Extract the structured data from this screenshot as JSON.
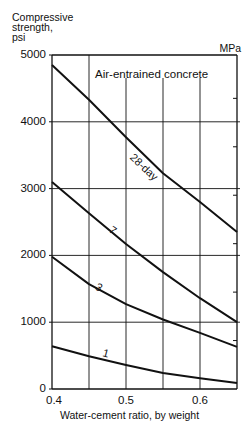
{
  "chart_data": {
    "type": "line",
    "title": "Air-entrained concrete",
    "xlabel": "Water-cement ratio, by weight",
    "ylabel": [
      "Compressive",
      "strength,",
      "psi"
    ],
    "ylabel_right": "MPa",
    "xlim": [
      0.4,
      0.65
    ],
    "ylim": [
      0,
      5000
    ],
    "x_ticks": [
      "0.4",
      "0.5",
      "0.6"
    ],
    "x_gridlines": [
      0.45,
      0.5,
      0.55,
      0.6
    ],
    "y_ticks": [
      "0",
      "1000",
      "2000",
      "3000",
      "4000",
      "5000"
    ],
    "y_right_ticks_mpa": [
      5,
      10,
      15,
      20,
      25,
      30
    ],
    "grid": true,
    "legend": "none (curves labeled inline)",
    "x": [
      0.4,
      0.45,
      0.5,
      0.55,
      0.6,
      0.65
    ],
    "series": [
      {
        "name": "28-day",
        "label": "28-day",
        "values": [
          4850,
          4330,
          3770,
          3230,
          2800,
          2350
        ]
      },
      {
        "name": "7-day",
        "label": "7",
        "values": [
          3100,
          2630,
          2170,
          1750,
          1360,
          1000
        ]
      },
      {
        "name": "3-day",
        "label": "3",
        "values": [
          1980,
          1570,
          1270,
          1040,
          840,
          630
        ]
      },
      {
        "name": "1-day",
        "label": "1",
        "values": [
          640,
          490,
          360,
          240,
          160,
          90
        ]
      }
    ]
  }
}
